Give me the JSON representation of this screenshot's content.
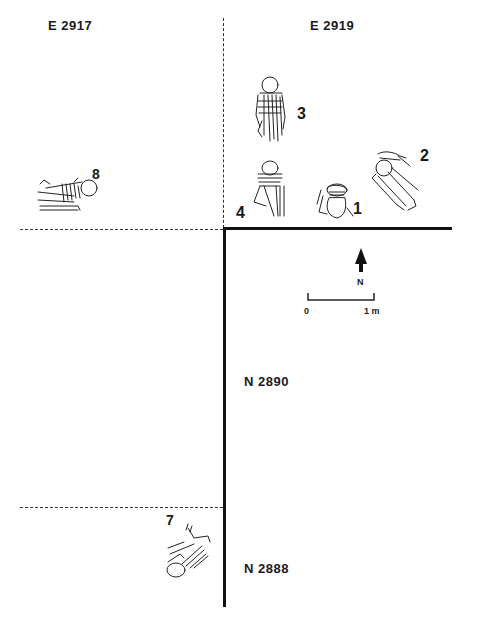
{
  "plan": {
    "grid_labels": {
      "east_west": [
        "E 2917",
        "E 2919"
      ],
      "north_south": [
        "N 2890",
        "N 2888"
      ]
    },
    "burials": [
      {
        "number": "1"
      },
      {
        "number": "2"
      },
      {
        "number": "3"
      },
      {
        "number": "4"
      },
      {
        "number": "7"
      },
      {
        "number": "8"
      }
    ],
    "north_arrow": {
      "label": "N"
    },
    "scale_bar": {
      "start": "0",
      "end": "1 m"
    }
  }
}
